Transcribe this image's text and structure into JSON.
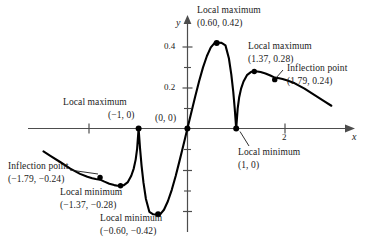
{
  "figure": {
    "axes": {
      "x_axis_label": "x",
      "y_axis_label": "y",
      "x_ticks": [
        {
          "value": -2,
          "label": ""
        },
        {
          "value": 2,
          "label": "2"
        }
      ],
      "y_ticks": [
        {
          "value": 0.2,
          "label": "0.2"
        },
        {
          "value": 0.4,
          "label": "0.4"
        },
        {
          "value": 0.1,
          "label": ""
        },
        {
          "value": 0.3,
          "label": ""
        },
        {
          "value": -0.1,
          "label": ""
        },
        {
          "value": -0.2,
          "label": ""
        },
        {
          "value": -0.3,
          "label": ""
        },
        {
          "value": -0.4,
          "label": ""
        },
        {
          "value": -0.5,
          "label": ""
        }
      ]
    },
    "annotations": [
      {
        "id": "inflection-left",
        "title": "Inflection point",
        "coords": "(−1.79, −0.24)",
        "point": {
          "x": -1.79,
          "y": -0.24
        }
      },
      {
        "id": "local-min-left-outer",
        "title": "Local minimum",
        "coords": "(−1.37, −0.28)",
        "point": {
          "x": -1.37,
          "y": -0.28
        }
      },
      {
        "id": "local-max-origin-left",
        "title": "Local maximum",
        "coords": "(−1, 0)",
        "point": {
          "x": -1,
          "y": 0
        }
      },
      {
        "id": "local-min-left-inner",
        "title": "Local minimum",
        "coords": "(−0.60, −0.42)",
        "point": {
          "x": -0.6,
          "y": -0.42
        }
      },
      {
        "id": "origin",
        "title": "",
        "coords": "(0, 0)",
        "point": {
          "x": 0,
          "y": 0
        }
      },
      {
        "id": "local-max-peak",
        "title": "Local maximum",
        "coords": "(0.60, 0.42)",
        "point": {
          "x": 0.6,
          "y": 0.42
        }
      },
      {
        "id": "local-min-right",
        "title": "Local minimum",
        "coords": "(1, 0)",
        "point": {
          "x": 1,
          "y": 0
        }
      },
      {
        "id": "local-max-right",
        "title": "Local maximum",
        "coords": "(1.37, 0.28)",
        "point": {
          "x": 1.37,
          "y": 0.28
        }
      },
      {
        "id": "inflection-right",
        "title": "Inflection point",
        "coords": "(1.79, 0.24)",
        "point": {
          "x": 1.79,
          "y": 0.24
        }
      }
    ]
  },
  "chart_data": {
    "type": "line",
    "title": "",
    "xlabel": "x",
    "ylabel": "y",
    "xlim": [
      -2.95,
      3.3
    ],
    "ylim": [
      -0.58,
      0.5
    ],
    "grid": false,
    "legend": null,
    "x_ticks": [
      -2,
      2
    ],
    "x_tick_labels": [
      "",
      "2"
    ],
    "y_ticks": [
      0.2,
      0.4
    ],
    "y_tick_labels": [
      "0.2",
      "0.4"
    ],
    "series": [
      {
        "name": "curve",
        "x": [
          -2.95,
          -2.8,
          -2.6,
          -2.4,
          -2.2,
          -2.05,
          -1.95,
          -1.88,
          -1.79,
          -1.7,
          -1.6,
          -1.5,
          -1.43,
          -1.37,
          -1.3,
          -1.22,
          -1.15,
          -1.1,
          -1.06,
          -1.03,
          -1.0,
          -0.97,
          -0.94,
          -0.9,
          -0.85,
          -0.78,
          -0.7,
          -0.65,
          -0.6,
          -0.55,
          -0.48,
          -0.4,
          -0.32,
          -0.24,
          -0.16,
          -0.1,
          -0.05,
          0.0,
          0.05,
          0.1,
          0.16,
          0.24,
          0.32,
          0.4,
          0.48,
          0.55,
          0.6,
          0.65,
          0.7,
          0.78,
          0.85,
          0.9,
          0.94,
          0.97,
          1.0,
          1.03,
          1.06,
          1.1,
          1.15,
          1.22,
          1.3,
          1.37,
          1.43,
          1.5,
          1.6,
          1.7,
          1.79,
          1.88,
          1.95,
          2.05,
          2.2,
          2.4,
          2.6,
          2.8,
          2.95
        ],
        "y": [
          -0.112,
          -0.135,
          -0.165,
          -0.196,
          -0.222,
          -0.236,
          -0.243,
          -0.247,
          -0.25,
          -0.26,
          -0.27,
          -0.277,
          -0.28,
          -0.281,
          -0.277,
          -0.262,
          -0.231,
          -0.196,
          -0.152,
          -0.098,
          0.0,
          -0.098,
          -0.18,
          -0.265,
          -0.345,
          -0.408,
          -0.42,
          -0.421,
          -0.422,
          -0.418,
          -0.398,
          -0.356,
          -0.3,
          -0.232,
          -0.157,
          -0.099,
          -0.05,
          0.0,
          0.05,
          0.099,
          0.157,
          0.232,
          0.3,
          0.356,
          0.398,
          0.418,
          0.422,
          0.421,
          0.42,
          0.408,
          0.345,
          0.265,
          0.18,
          0.098,
          0.0,
          0.098,
          0.152,
          0.196,
          0.231,
          0.262,
          0.277,
          0.281,
          0.28,
          0.277,
          0.27,
          0.26,
          0.25,
          0.247,
          0.243,
          0.236,
          0.222,
          0.196,
          0.165,
          0.135,
          0.112
        ]
      }
    ],
    "marked_points": [
      {
        "label": "Inflection point",
        "x": -1.79,
        "y": -0.24
      },
      {
        "label": "Local minimum",
        "x": -1.37,
        "y": -0.28
      },
      {
        "label": "Local maximum",
        "x": -1.0,
        "y": 0.0
      },
      {
        "label": "Local minimum",
        "x": -0.6,
        "y": -0.42
      },
      {
        "label": "Origin",
        "x": 0.0,
        "y": 0.0
      },
      {
        "label": "Local maximum",
        "x": 0.6,
        "y": 0.42
      },
      {
        "label": "Local minimum",
        "x": 1.0,
        "y": 0.0
      },
      {
        "label": "Local maximum",
        "x": 1.37,
        "y": 0.28
      },
      {
        "label": "Inflection point",
        "x": 1.79,
        "y": 0.24
      }
    ]
  },
  "labels": {
    "local_maximum": "Local maximum",
    "local_minimum": "Local minimum",
    "inflection_point": "Inflection point",
    "coord_inflection_left": "(−1.79, −0.24)",
    "coord_min_left_outer": "(−1.37, −0.28)",
    "coord_max_minus_one": "(−1, 0)",
    "coord_min_left_inner": "(−0.60, −0.42)",
    "coord_origin": "(0, 0)",
    "coord_max_peak": "(0.60, 0.42)",
    "coord_min_right": "(1, 0)",
    "coord_max_right": "(1.37, 0.28)",
    "coord_inflection_right": "(1.79, 0.24)",
    "tick_two": "2",
    "tick_zero_point_two": "0.2",
    "tick_zero_point_four": "0.4",
    "axis_x": "x",
    "axis_y": "y"
  },
  "colors": {
    "curve": "#000000",
    "axis": "#4d4d4d",
    "text": "#1a1a1a",
    "background": "#ffffff"
  }
}
